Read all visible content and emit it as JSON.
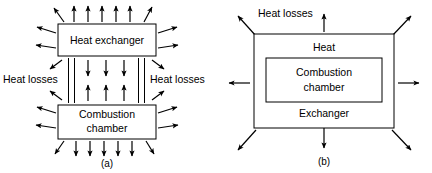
{
  "figure": {
    "panels": [
      {
        "caption": "(a)",
        "boxes": [
          {
            "name": "heat-exchanger",
            "label": "Heat exchanger"
          },
          {
            "name": "combustion-chamber",
            "label_line1": "Combustion",
            "label_line2": "chamber"
          }
        ],
        "annotations": [
          {
            "name": "heat-losses-left",
            "label": "Heat losses"
          },
          {
            "name": "heat-losses-right",
            "label": "Heat losses"
          }
        ],
        "arrow_groups": {
          "top_outward": 7,
          "bottom_outward": 7,
          "left_outward": 6,
          "right_outward": 6,
          "interior_down": 3,
          "interior_up": 3,
          "pipes": 4
        }
      },
      {
        "caption": "(b)",
        "boxes": [
          {
            "name": "outer-exchanger",
            "label_top": "Heat",
            "label_bottom": "Exchanger"
          },
          {
            "name": "combustion-chamber",
            "label_line1": "Combustion",
            "label_line2": "chamber"
          }
        ],
        "annotations": [
          {
            "name": "heat-losses",
            "label": "Heat losses"
          }
        ],
        "arrow_groups": {
          "radial_outward": 8
        }
      }
    ],
    "colors": {
      "stroke": "#000000",
      "fill": "#ffffff",
      "background": "#ffffff"
    }
  }
}
